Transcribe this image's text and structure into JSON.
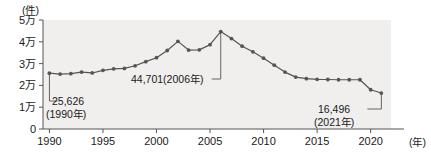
{
  "chart_data": {
    "type": "line",
    "title": "",
    "subtitle": "",
    "xlabel": "(年)",
    "ylabel": "(件)",
    "xlim": [
      1989.4,
      2021.9
    ],
    "ylim": [
      0,
      50000
    ],
    "grid": false,
    "legend": null,
    "y_tick_values": [
      0,
      10000,
      20000,
      30000,
      40000,
      50000
    ],
    "y_tick_labels": [
      "0",
      "1万",
      "2万",
      "3万",
      "4万",
      "5万"
    ],
    "x_tick_values": [
      1990,
      1995,
      2000,
      2005,
      2010,
      2015,
      2020
    ],
    "x_tick_labels": [
      "1990",
      "1995",
      "2000",
      "2005",
      "2010",
      "2015",
      "2020"
    ],
    "series": [
      {
        "name": "件数",
        "marker": "circle",
        "color": "#555555",
        "x": [
          1990,
          1991,
          1992,
          1993,
          1994,
          1995,
          1996,
          1997,
          1998,
          1999,
          2000,
          2001,
          2002,
          2003,
          2004,
          2005,
          2006,
          2007,
          2008,
          2009,
          2010,
          2011,
          2012,
          2013,
          2014,
          2015,
          2016,
          2017,
          2018,
          2019,
          2020,
          2021
        ],
        "values": [
          25626,
          25200,
          25400,
          26100,
          25700,
          26900,
          27600,
          27800,
          29000,
          30900,
          32700,
          36000,
          40200,
          36200,
          36300,
          38700,
          44701,
          41500,
          38000,
          35400,
          32500,
          29300,
          26100,
          23800,
          23100,
          22800,
          22700,
          22600,
          22600,
          22600,
          18000,
          16496
        ]
      }
    ],
    "annotations": [
      {
        "id": "start",
        "value_label": "25,626",
        "year_label": "(1990年)",
        "points_to_year": 1990
      },
      {
        "id": "peak",
        "value_label": "44,701(2006年)",
        "year_label": "",
        "points_to_year": 2006
      },
      {
        "id": "end",
        "value_label": "16,496",
        "year_label": "(2021年)",
        "points_to_year": 2021
      }
    ],
    "plot_background": "#f0efed",
    "axis_color": "#555555",
    "line_color": "#555555"
  }
}
